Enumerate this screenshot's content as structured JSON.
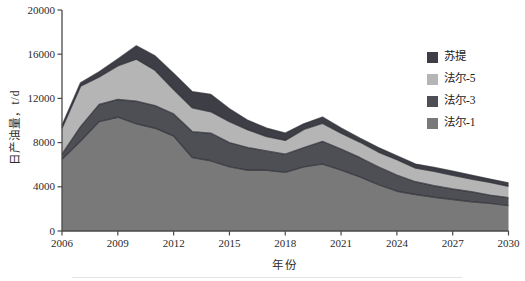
{
  "chart_data": {
    "type": "area",
    "stacked": true,
    "title": "",
    "xlabel": "年份",
    "ylabel": "日产油量，t/d",
    "grid": false,
    "legend_position": "right",
    "xlim": [
      2006,
      2030
    ],
    "ylim": [
      0,
      20000
    ],
    "x_ticks": [
      2006,
      2009,
      2012,
      2015,
      2018,
      2021,
      2024,
      2027,
      2030
    ],
    "y_ticks": [
      0,
      4000,
      8000,
      12000,
      16000,
      20000
    ],
    "x": [
      2006,
      2007,
      2008,
      2009,
      2010,
      2011,
      2012,
      2013,
      2014,
      2015,
      2016,
      2017,
      2018,
      2019,
      2020,
      2021,
      2022,
      2023,
      2024,
      2025,
      2026,
      2027,
      2028,
      2029,
      2030
    ],
    "series": [
      {
        "id": "faer-1",
        "name": "法尔-1",
        "color": "#797979",
        "values": [
          6500,
          8150,
          9900,
          10300,
          9700,
          9300,
          8600,
          6650,
          6350,
          5800,
          5500,
          5500,
          5300,
          5800,
          6050,
          5500,
          4900,
          4200,
          3600,
          3300,
          3050,
          2850,
          2650,
          2500,
          2300
        ]
      },
      {
        "id": "faer-3",
        "name": "法尔-3",
        "color": "#4e4e55",
        "values": [
          450,
          1300,
          1550,
          1600,
          2050,
          2050,
          2000,
          2350,
          2500,
          2200,
          2050,
          1750,
          1650,
          1750,
          2050,
          1900,
          1750,
          1600,
          1450,
          1150,
          1050,
          950,
          900,
          750,
          700
        ]
      },
      {
        "id": "faer-5",
        "name": "法尔-5",
        "color": "#b5b5b5",
        "values": [
          2350,
          3650,
          2500,
          3050,
          3800,
          3200,
          2200,
          2150,
          1950,
          1900,
          1600,
          1300,
          1250,
          1650,
          1650,
          1450,
          1400,
          1350,
          1400,
          1250,
          1300,
          1250,
          1150,
          1150,
          1050
        ]
      },
      {
        "id": "suti",
        "name": "苏提",
        "color": "#3e3e47",
        "values": [
          250,
          300,
          450,
          600,
          1200,
          1300,
          1450,
          1450,
          1550,
          1150,
          850,
          750,
          650,
          500,
          550,
          450,
          350,
          400,
          350,
          350,
          350,
          350,
          350,
          300,
          300
        ]
      }
    ],
    "boundary_stroke_color": "#2f2f37",
    "axis_color": "#4a4a4a"
  },
  "legend": {
    "items": [
      {
        "id": "suti",
        "label": "苏提",
        "color": "#3e3e47"
      },
      {
        "id": "faer-5",
        "label": "法尔-5",
        "color": "#b5b5b5"
      },
      {
        "id": "faer-3",
        "label": "法尔-3",
        "color": "#4e4e55"
      },
      {
        "id": "faer-1",
        "label": "法尔-1",
        "color": "#797979"
      }
    ]
  }
}
